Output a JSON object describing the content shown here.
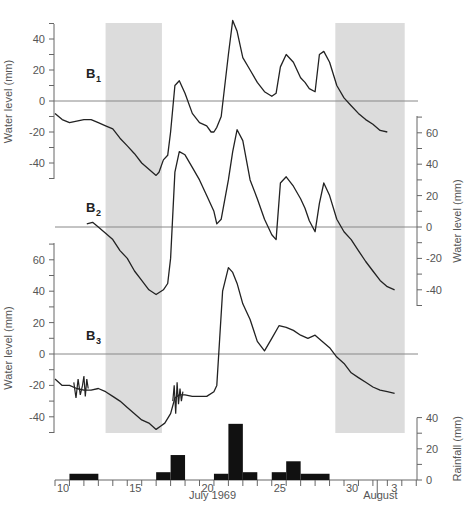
{
  "chart_data": {
    "type": "line",
    "title": "",
    "xlabel": "July 1969",
    "xlabel_secondary": "August",
    "x_tick_labels": [
      "10",
      "15",
      "20",
      "25",
      "30",
      "3"
    ],
    "shaded_periods": [
      {
        "start_day": 13.5,
        "end_day": 17.4
      },
      {
        "start_day": 29.4,
        "end_day": 34.2
      }
    ],
    "panels": [
      {
        "name": "B1",
        "label_main": "B",
        "label_sub": "1",
        "ylabel": "Water level (mm)",
        "axis_side": "left",
        "yticks": [
          "40",
          "20",
          "0",
          "-20",
          "-40"
        ],
        "ylim": [
          -50,
          50
        ],
        "series": {
          "x": [
            10.0,
            10.5,
            11.0,
            11.5,
            12.0,
            12.5,
            13.0,
            13.5,
            14.0,
            14.5,
            15.0,
            15.5,
            16.0,
            16.5,
            17.0,
            17.2,
            17.5,
            17.8,
            18.0,
            18.3,
            18.6,
            19.0,
            19.5,
            20.0,
            20.5,
            20.8,
            21.0,
            21.2,
            21.5,
            22.0,
            22.3,
            22.6,
            23.0,
            23.5,
            24.0,
            24.5,
            25.0,
            25.3,
            25.6,
            26.0,
            26.5,
            27.0,
            27.3,
            27.6,
            28.0,
            28.3,
            28.6,
            29.0,
            29.5,
            30.0,
            30.5,
            31.0,
            31.5,
            32.0,
            32.5,
            33.0
          ],
          "y": [
            -8,
            -12,
            -14,
            -13,
            -12,
            -12,
            -14,
            -16,
            -18,
            -24,
            -29,
            -34,
            -40,
            -44,
            -48,
            -46,
            -38,
            -35,
            -20,
            10,
            13,
            5,
            -8,
            -14,
            -16,
            -20,
            -20,
            -17,
            -10,
            30,
            52,
            45,
            28,
            20,
            12,
            6,
            3,
            5,
            22,
            30,
            25,
            15,
            12,
            8,
            6,
            30,
            32,
            25,
            10,
            2,
            -3,
            -8,
            -12,
            -15,
            -19,
            -20
          ]
        }
      },
      {
        "name": "B2",
        "label_main": "B",
        "label_sub": "2",
        "ylabel": "Water level (mm)",
        "axis_side": "right",
        "yticks": [
          "60",
          "40",
          "20",
          "0",
          "-20",
          "-40"
        ],
        "ylim": [
          -50,
          70
        ],
        "series": {
          "x": [
            12.2,
            12.6,
            13.0,
            13.5,
            14.0,
            14.5,
            15.0,
            15.5,
            16.0,
            16.5,
            17.0,
            17.5,
            17.8,
            18.0,
            18.3,
            18.6,
            19.0,
            19.5,
            20.0,
            20.5,
            21.0,
            21.2,
            21.5,
            22.0,
            22.3,
            22.6,
            23.0,
            23.5,
            24.0,
            24.5,
            25.0,
            25.3,
            25.6,
            26.0,
            26.5,
            27.0,
            27.3,
            27.6,
            28.0,
            28.3,
            28.6,
            29.0,
            29.5,
            30.0,
            30.5,
            31.0,
            31.5,
            32.0,
            32.5,
            33.0,
            33.5
          ],
          "y": [
            2,
            3,
            0,
            -4,
            -8,
            -15,
            -20,
            -28,
            -34,
            -40,
            -43,
            -40,
            -36,
            -20,
            35,
            48,
            46,
            38,
            30,
            20,
            10,
            2,
            5,
            30,
            48,
            62,
            55,
            30,
            18,
            5,
            -5,
            -8,
            28,
            32,
            26,
            18,
            12,
            4,
            -3,
            15,
            28,
            20,
            5,
            -3,
            -8,
            -15,
            -22,
            -28,
            -34,
            -38,
            -40
          ]
        }
      },
      {
        "name": "B3",
        "label_main": "B",
        "label_sub": "3",
        "ylabel": "Water level (mm)",
        "axis_side": "left",
        "yticks": [
          "60",
          "40",
          "20",
          "0",
          "-20",
          "-40"
        ],
        "ylim": [
          -50,
          65
        ],
        "series": {
          "x": [
            10.0,
            10.5,
            11.0,
            11.5,
            12.0,
            12.5,
            13.0,
            13.5,
            14.0,
            14.5,
            15.0,
            15.5,
            16.0,
            16.5,
            17.0,
            17.3,
            17.6,
            18.0,
            18.3,
            18.6,
            19.0,
            19.5,
            20.0,
            20.5,
            21.0,
            21.2,
            21.4,
            21.6,
            22.0,
            22.3,
            22.6,
            23.0,
            23.5,
            24.0,
            24.5,
            25.0,
            25.5,
            26.0,
            26.5,
            27.0,
            27.5,
            28.0,
            28.5,
            29.0,
            29.5,
            30.0,
            30.5,
            31.0,
            31.5,
            32.0,
            32.5,
            33.0,
            33.5
          ],
          "y": [
            -16,
            -20,
            -20,
            -22,
            -23,
            -23,
            -22,
            -24,
            -27,
            -30,
            -34,
            -38,
            -42,
            -44,
            -48,
            -46,
            -44,
            -38,
            -28,
            -26,
            -26,
            -27,
            -27,
            -27,
            -24,
            -20,
            10,
            40,
            55,
            52,
            45,
            32,
            22,
            8,
            2,
            10,
            18,
            17,
            15,
            12,
            10,
            12,
            8,
            4,
            -2,
            -6,
            -12,
            -15,
            -18,
            -21,
            -23,
            -24,
            -25
          ]
        }
      }
    ],
    "rainfall": {
      "type": "bar",
      "ylabel": "Rainfall (mm)",
      "yticks": [
        "40",
        "20",
        "0"
      ],
      "ylim": [
        0,
        40
      ],
      "bars": [
        {
          "start_day": 11,
          "end_day": 13,
          "value": 4
        },
        {
          "start_day": 17,
          "end_day": 18,
          "value": 5
        },
        {
          "start_day": 18,
          "end_day": 19,
          "value": 16
        },
        {
          "start_day": 21,
          "end_day": 22,
          "value": 4
        },
        {
          "start_day": 22,
          "end_day": 23,
          "value": 36
        },
        {
          "start_day": 23,
          "end_day": 24,
          "value": 5
        },
        {
          "start_day": 25,
          "end_day": 26,
          "value": 5
        },
        {
          "start_day": 26,
          "end_day": 27,
          "value": 12
        },
        {
          "start_day": 27,
          "end_day": 29,
          "value": 4
        }
      ]
    }
  }
}
